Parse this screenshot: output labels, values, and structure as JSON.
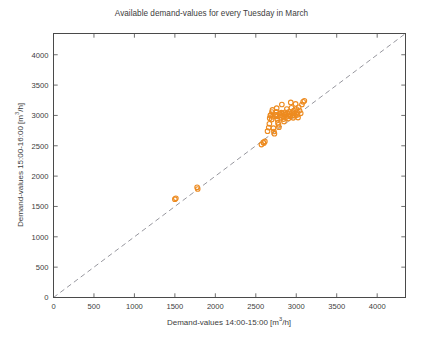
{
  "chart_data": {
    "type": "scatter",
    "title": "Available demand-values for every Tuesday in March",
    "xlabel": "Demand-values 14:00-15:00 [m³/h]",
    "ylabel": "Demand-values 15:00-16:00 [m³/h]",
    "xlim": [
      0,
      4350
    ],
    "ylim": [
      0,
      4350
    ],
    "xticks": [
      0,
      500,
      1000,
      1500,
      2000,
      2500,
      3000,
      3500,
      4000
    ],
    "yticks": [
      0,
      500,
      1000,
      1500,
      2000,
      2500,
      3000,
      3500,
      4000
    ],
    "xticklabels": [
      "0",
      "500",
      "1000",
      "1500",
      "2000",
      "2500",
      "3000",
      "3500",
      "4000"
    ],
    "yticklabels": [
      "0",
      "500",
      "1000",
      "1500",
      "2000",
      "2500",
      "3000",
      "3500",
      "4000"
    ],
    "grid": false,
    "legend": null,
    "marker": {
      "style": "open-circle",
      "color": "#ED8B20",
      "size": 4.6,
      "linewidth": 1.1
    },
    "reference_line": {
      "name": "identity-line",
      "style": "dashed",
      "color": "#8b8b93",
      "from": [
        0,
        0
      ],
      "to": [
        4350,
        4350
      ]
    },
    "series": [
      {
        "name": "Tuesdays in March",
        "points": [
          [
            1500,
            1620
          ],
          [
            1512,
            1635
          ],
          [
            1775,
            1815
          ],
          [
            1782,
            1788
          ],
          [
            2570,
            2520
          ],
          [
            2592,
            2558
          ],
          [
            2600,
            2545
          ],
          [
            2612,
            2572
          ],
          [
            2645,
            2740
          ],
          [
            2660,
            2800
          ],
          [
            2668,
            2862
          ],
          [
            2672,
            2955
          ],
          [
            2680,
            3000
          ],
          [
            2688,
            3008
          ],
          [
            2696,
            2935
          ],
          [
            2700,
            3055
          ],
          [
            2706,
            3090
          ],
          [
            2712,
            2980
          ],
          [
            2718,
            2790
          ],
          [
            2724,
            2735
          ],
          [
            2730,
            2700
          ],
          [
            2740,
            3010
          ],
          [
            2748,
            3008
          ],
          [
            2752,
            3060
          ],
          [
            2758,
            3120
          ],
          [
            2762,
            2985
          ],
          [
            2768,
            2930
          ],
          [
            2774,
            2880
          ],
          [
            2780,
            2845
          ],
          [
            2786,
            2805
          ],
          [
            2792,
            3030
          ],
          [
            2800,
            3005
          ],
          [
            2808,
            2960
          ],
          [
            2815,
            3045
          ],
          [
            2822,
            3180
          ],
          [
            2830,
            3030
          ],
          [
            2836,
            2985
          ],
          [
            2842,
            2940
          ],
          [
            2848,
            2900
          ],
          [
            2855,
            3010
          ],
          [
            2862,
            3052
          ],
          [
            2870,
            3020
          ],
          [
            2876,
            2975
          ],
          [
            2884,
            3105
          ],
          [
            2890,
            3035
          ],
          [
            2896,
            2995
          ],
          [
            2902,
            2948
          ],
          [
            2910,
            3060
          ],
          [
            2918,
            3022
          ],
          [
            2924,
            2985
          ],
          [
            2932,
            3215
          ],
          [
            2940,
            3125
          ],
          [
            2948,
            3042
          ],
          [
            2956,
            3000
          ],
          [
            2962,
            2960
          ],
          [
            2970,
            3080
          ],
          [
            2978,
            3035
          ],
          [
            2985,
            2995
          ],
          [
            2992,
            3190
          ],
          [
            3000,
            3105
          ],
          [
            3008,
            3055
          ],
          [
            3015,
            3010
          ],
          [
            3022,
            2965
          ],
          [
            3030,
            3135
          ],
          [
            3040,
            3080
          ],
          [
            3055,
            3035
          ],
          [
            3070,
            3180
          ],
          [
            3085,
            3225
          ],
          [
            3100,
            3240
          ]
        ]
      }
    ]
  }
}
